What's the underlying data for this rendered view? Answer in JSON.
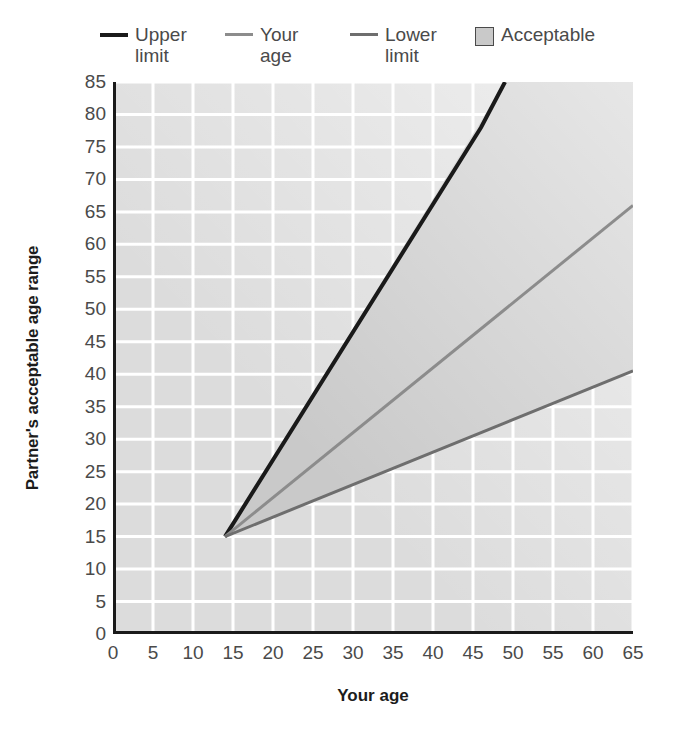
{
  "legend": {
    "items": [
      {
        "label": "Upper limit",
        "marker": "line-black",
        "color": "#1a1a1a",
        "name": "legend-upper-limit"
      },
      {
        "label": "Your age",
        "marker": "line-midgray",
        "color": "#8c8c8c",
        "name": "legend-your-age"
      },
      {
        "label": "Lower limit",
        "marker": "line-darkgray",
        "color": "#6e6e6e",
        "name": "legend-lower-limit"
      },
      {
        "label": "Acceptable",
        "marker": "filled-square",
        "color": "#c9c9c9",
        "name": "legend-acceptable"
      }
    ]
  },
  "axes": {
    "x_title": "Your age",
    "y_title": "Partner's acceptable age range"
  },
  "chart_data": {
    "type": "line",
    "title": "",
    "xlabel": "Your age",
    "ylabel": "Partner's acceptable age range",
    "xlim": [
      0,
      65
    ],
    "ylim": [
      0,
      85
    ],
    "xticks": [
      0,
      5,
      10,
      15,
      20,
      25,
      30,
      35,
      40,
      45,
      50,
      55,
      60,
      65
    ],
    "yticks": [
      0,
      5,
      10,
      15,
      20,
      25,
      30,
      35,
      40,
      45,
      50,
      55,
      60,
      65,
      70,
      75,
      80,
      85
    ],
    "grid": true,
    "grid_step_x": 5,
    "grid_step_y": 5,
    "grid_color": "#ffffff",
    "plot_bg": "#dcdcdc",
    "legend_position": "above-plot",
    "series": [
      {
        "name": "Upper limit",
        "color": "#1a1a1a",
        "width": 4,
        "comment": "(your age - 7) * 2",
        "points": [
          [
            14,
            15
          ],
          [
            46,
            78
          ],
          [
            49,
            85
          ]
        ]
      },
      {
        "name": "Your age",
        "color": "#8c8c8c",
        "width": 3,
        "comment": "y = x + 1 approx; identity line",
        "points": [
          [
            14,
            15
          ],
          [
            65,
            66
          ]
        ]
      },
      {
        "name": "Lower limit",
        "color": "#6e6e6e",
        "width": 3,
        "comment": "your age / 2 + 7",
        "points": [
          [
            14,
            15
          ],
          [
            65,
            40.5
          ]
        ]
      }
    ],
    "shaded_region": {
      "name": "Acceptable",
      "fill": "#c9c9c9",
      "between": [
        "Lower limit",
        "Upper limit"
      ],
      "polygon": [
        [
          14,
          15
        ],
        [
          49,
          85
        ],
        [
          65,
          85
        ],
        [
          65,
          40.5
        ]
      ]
    },
    "annotations": [
      {
        "text": "All three lines converge at (14, 15)",
        "x": 14,
        "y": 15
      }
    ]
  }
}
